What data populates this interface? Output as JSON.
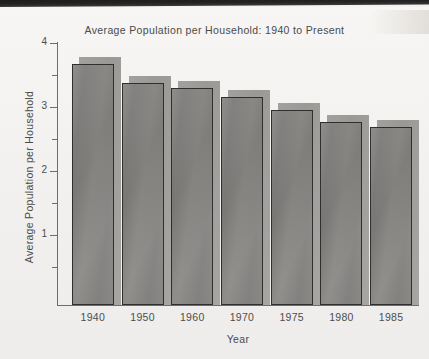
{
  "chart_data": {
    "type": "bar",
    "title": "Average Population per Household: 1940 to Present",
    "xlabel": "Year",
    "ylabel": "Average Population per Household",
    "categories": [
      "1940",
      "1950",
      "1960",
      "1970",
      "1975",
      "1980",
      "1985"
    ],
    "values": [
      3.67,
      3.38,
      3.3,
      3.16,
      2.95,
      2.77,
      2.69
    ],
    "ylim": [
      0.5,
      4
    ],
    "ytick_labels": [
      "1",
      "2",
      "3",
      "4"
    ],
    "ytick_values": [
      1,
      2,
      3,
      4
    ],
    "yminor_values": [
      0.5,
      1.5,
      2.5,
      3.5
    ],
    "grid": false,
    "legend": "none",
    "series": [
      {
        "name": "Average Population per Household",
        "values": [
          3.67,
          3.38,
          3.3,
          3.16,
          2.95,
          2.77,
          2.69
        ]
      }
    ],
    "colors": {
      "bar_face": "#8a8886",
      "bar_outline": "#2f2f2f",
      "bar_shadow": "#a3a19e",
      "axis": "#6d6d6d",
      "text": "#4a4a4a",
      "background": "#f2f1ef"
    }
  }
}
